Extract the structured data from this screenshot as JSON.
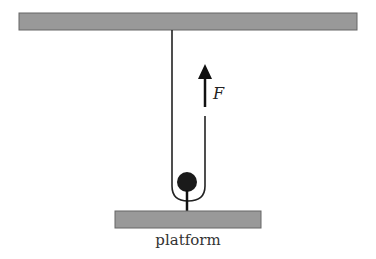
{
  "diagram": {
    "type": "physics-free-body",
    "labels": {
      "force": "F",
      "platform": "platform"
    },
    "colors": {
      "bar_fill": "#999999",
      "bar_stroke": "#555555",
      "rope": "#222222",
      "ball": "#1a1a1a",
      "arrow": "#111111"
    },
    "elements": [
      {
        "name": "ceiling-beam",
        "kind": "rect",
        "x": 19,
        "y": 13,
        "w": 338,
        "h": 17
      },
      {
        "name": "rope-left",
        "kind": "line"
      },
      {
        "name": "rope-right-with-force-arrow",
        "kind": "line"
      },
      {
        "name": "ball",
        "kind": "circle"
      },
      {
        "name": "platform",
        "kind": "rect",
        "x": 115,
        "y": 211,
        "w": 146,
        "h": 17
      }
    ]
  }
}
